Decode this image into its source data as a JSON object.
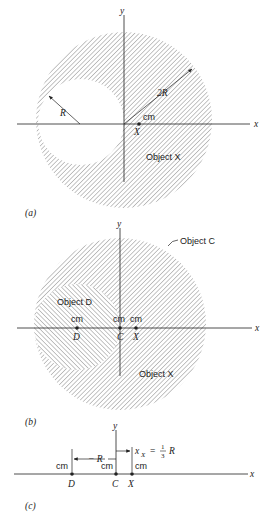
{
  "panels": {
    "a": {
      "label": "(a)",
      "axis_x": "x",
      "axis_y": "y",
      "radius_small": "R",
      "radius_large": "2R",
      "cm_text": "cm",
      "point_x": "X",
      "object_label": "Object X"
    },
    "b": {
      "label": "(b)",
      "axis_x": "x",
      "axis_y": "y",
      "object_c_label": "Object C",
      "object_d_label": "Object D",
      "object_x_label": "Object X",
      "cm_d": "cm",
      "cm_c": "cm",
      "cm_x": "cm",
      "point_d": "D",
      "point_c": "C",
      "point_x": "X"
    },
    "c": {
      "label": "(c)",
      "axis_x": "x",
      "axis_y": "y",
      "dist_d": "− R",
      "dist_x_var": "x",
      "dist_x_sub": "X",
      "dist_x_eq": "=",
      "frac_num": "1",
      "frac_den": "3",
      "dist_x_r": "R",
      "cm_d": "cm",
      "cm_c": "cm",
      "cm_x": "cm",
      "point_d": "D",
      "point_c": "C",
      "point_x": "X"
    }
  },
  "colors": {
    "ink": "#222222",
    "hatch": "#8a8a8a"
  }
}
